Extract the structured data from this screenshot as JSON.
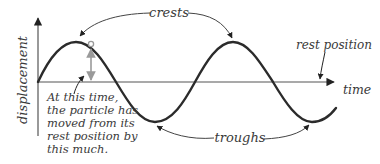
{
  "diagram": {
    "axes": {
      "y_label": "displacement",
      "x_label": "time"
    },
    "labels": {
      "crests": "crests",
      "troughs": "troughs",
      "rest_position": "rest position"
    },
    "annotation": {
      "lines": [
        "At this time,",
        "the particle has",
        "moved from its",
        "rest position by",
        "this much."
      ]
    },
    "colors": {
      "wave": "#2b2b2b",
      "axis": "#555555",
      "marker": "#9a9a9a",
      "label_text": "#3a3a3a"
    }
  }
}
